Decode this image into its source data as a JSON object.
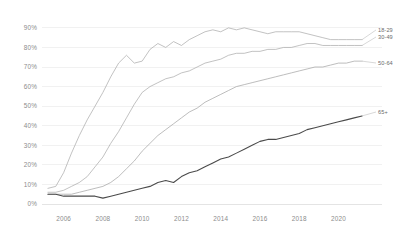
{
  "chart_data": {
    "type": "line",
    "title": "",
    "subtitle": "",
    "xlabel": "",
    "ylabel": "",
    "xlim": [
      2005.0,
      2021.4
    ],
    "ylim": [
      0,
      93
    ],
    "grid": true,
    "grid_axis": "y",
    "legend_position": "right-inline-labels",
    "y_ticks": [
      0,
      10,
      20,
      30,
      40,
      50,
      60,
      70,
      80,
      90
    ],
    "y_tick_labels": [
      "0%",
      "10%",
      "20%",
      "30%",
      "40%",
      "50%",
      "60%",
      "70%",
      "80%",
      "90%"
    ],
    "x_ticks": [
      2006,
      2008,
      2010,
      2012,
      2014,
      2016,
      2018,
      2020
    ],
    "x_tick_labels": [
      "2006",
      "2008",
      "2010",
      "2012",
      "2014",
      "2016",
      "2018",
      "2020"
    ],
    "x": [
      2005.2,
      2005.6,
      2006.0,
      2006.4,
      2006.8,
      2007.2,
      2007.6,
      2008.0,
      2008.4,
      2008.8,
      2009.2,
      2009.6,
      2010.0,
      2010.4,
      2010.8,
      2011.2,
      2011.6,
      2012.0,
      2012.4,
      2012.8,
      2013.2,
      2013.6,
      2014.0,
      2014.4,
      2014.8,
      2015.2,
      2015.6,
      2016.0,
      2016.4,
      2016.8,
      2017.2,
      2017.6,
      2018.0,
      2018.4,
      2018.8,
      2019.2,
      2019.6,
      2020.0,
      2020.4,
      2020.8,
      2021.2
    ],
    "series": [
      {
        "name": "18-29",
        "label": "18-29",
        "color": "#a8a8a8",
        "line_width": 0.7,
        "end_value": 84,
        "values": [
          8,
          9,
          16,
          26,
          35,
          43,
          50,
          57,
          65,
          72,
          76,
          72,
          73,
          79,
          82,
          80,
          83,
          81,
          84,
          86,
          88,
          89,
          88,
          90,
          89,
          90,
          89,
          88,
          87,
          88,
          88,
          88,
          88,
          87,
          86,
          85,
          84,
          84,
          84,
          84,
          84
        ]
      },
      {
        "name": "30-49",
        "label": "30-49",
        "color": "#a8a8a8",
        "line_width": 0.7,
        "end_value": 81,
        "values": [
          6,
          6,
          7,
          9,
          11,
          14,
          19,
          24,
          31,
          37,
          44,
          51,
          57,
          60,
          62,
          64,
          65,
          67,
          68,
          70,
          72,
          73,
          74,
          76,
          77,
          77,
          78,
          78,
          79,
          79,
          80,
          80,
          81,
          82,
          82,
          81,
          81,
          81,
          81,
          81,
          81
        ]
      },
      {
        "name": "50-64",
        "label": "50-64",
        "color": "#a0a0a0",
        "line_width": 0.7,
        "end_value": 73,
        "values": [
          5,
          5,
          5,
          5,
          6,
          7,
          8,
          9,
          11,
          14,
          18,
          22,
          27,
          31,
          35,
          38,
          41,
          44,
          47,
          49,
          52,
          54,
          56,
          58,
          60,
          61,
          62,
          63,
          64,
          65,
          66,
          67,
          68,
          69,
          70,
          70,
          71,
          72,
          72,
          73,
          73
        ]
      },
      {
        "name": "65+",
        "label": "65+",
        "color": "#4a4a4a",
        "line_width": 1.1,
        "end_value": 45,
        "values": [
          5,
          5,
          4,
          4,
          4,
          4,
          4,
          3,
          4,
          5,
          6,
          7,
          8,
          9,
          11,
          12,
          11,
          14,
          16,
          17,
          19,
          21,
          23,
          24,
          26,
          28,
          30,
          32,
          33,
          33,
          34,
          35,
          36,
          38,
          39,
          40,
          41,
          42,
          43,
          44,
          45
        ]
      }
    ],
    "series_label_anchors": [
      {
        "label": "18-29",
        "x": 378,
        "y": 30
      },
      {
        "label": "30-49",
        "x": 378,
        "y": 37
      },
      {
        "label": "50-64",
        "x": 378,
        "y": 63
      },
      {
        "label": "65+",
        "x": 378,
        "y": 112
      }
    ]
  },
  "colors": {
    "background": "#ffffff",
    "gridline": "#e8e8e8",
    "tick_label": "#8c8c8c",
    "series_label": "#6b6b6b",
    "highlight_series": "#4a4a4a"
  }
}
